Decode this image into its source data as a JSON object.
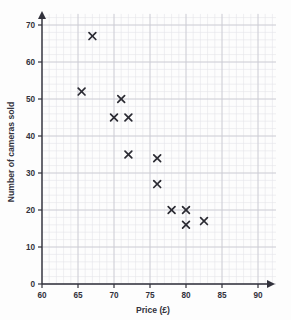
{
  "chart_data": {
    "type": "scatter",
    "title": "",
    "xlabel": "Price (£)",
    "ylabel": "Number of cameras sold",
    "xlim": [
      60,
      92.5
    ],
    "ylim": [
      0,
      73
    ],
    "xticks": [
      60,
      65,
      70,
      75,
      80,
      85,
      90
    ],
    "yticks": [
      0,
      10,
      20,
      30,
      40,
      50,
      60,
      70
    ],
    "xtick_labels": [
      "60",
      "65",
      "70",
      "75",
      "80",
      "85",
      "90"
    ],
    "ytick_labels": [
      "0",
      "10",
      "20",
      "30",
      "40",
      "50",
      "60",
      "70"
    ],
    "grid": true,
    "grid_minor_step_x": 1,
    "grid_minor_step_y": 2,
    "legend": null,
    "marker": "x",
    "marker_color": "#2b2b33",
    "points": [
      {
        "x": 65.5,
        "y": 52
      },
      {
        "x": 67,
        "y": 67
      },
      {
        "x": 70,
        "y": 45
      },
      {
        "x": 71,
        "y": 50
      },
      {
        "x": 72,
        "y": 45
      },
      {
        "x": 72,
        "y": 35
      },
      {
        "x": 76,
        "y": 34
      },
      {
        "x": 76,
        "y": 27
      },
      {
        "x": 78,
        "y": 20
      },
      {
        "x": 80,
        "y": 20
      },
      {
        "x": 80,
        "y": 16
      },
      {
        "x": 82.5,
        "y": 17
      }
    ]
  },
  "colors": {
    "background": "#fdfdfd",
    "grid_minor": "#e4e4ea",
    "grid_major": "#c9c9d2",
    "axis": "#32323c",
    "marker": "#2b2b33"
  }
}
